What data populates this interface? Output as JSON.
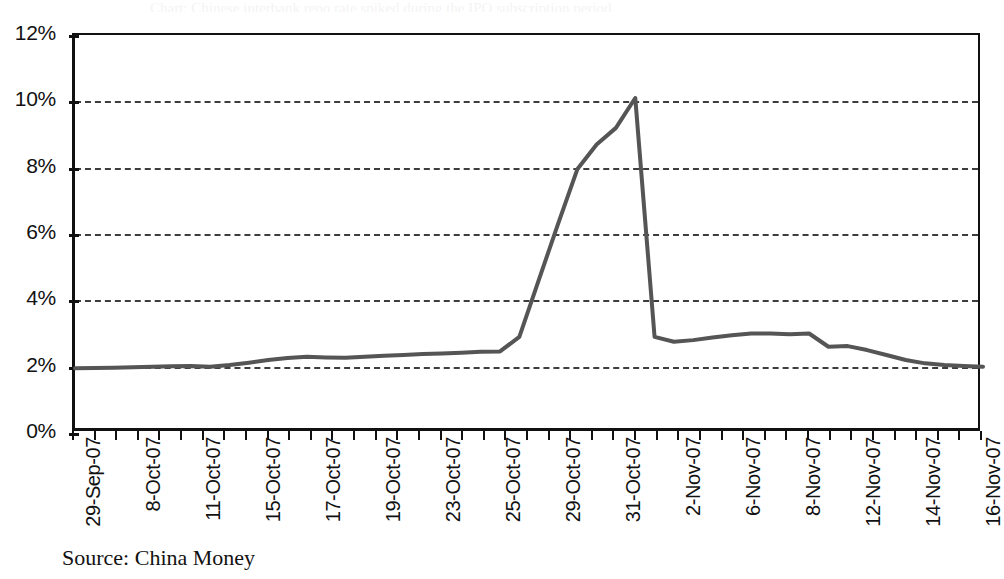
{
  "figure": {
    "source_note": "Source: China Money",
    "header_remnant": "Chart: Chinese interbank repo rate spiked during the IPO subscription period"
  },
  "chart_data": {
    "type": "line",
    "title": "",
    "xlabel": "",
    "ylabel": "",
    "ylim": [
      0,
      12
    ],
    "ytick_values": [
      0,
      2,
      4,
      6,
      8,
      10,
      12
    ],
    "ytick_labels": [
      "0%",
      "2%",
      "4%",
      "6%",
      "8%",
      "10%",
      "12%"
    ],
    "grid": true,
    "grid_style": "dashed-horizontal",
    "legend": "none",
    "series_color": "#555555",
    "series_width_px": 4,
    "x_tick_count": 42,
    "xtick_labels": [
      "29-Sep-07",
      "8-Oct-07",
      "11-Oct-07",
      "15-Oct-07",
      "17-Oct-07",
      "19-Oct-07",
      "23-Oct-07",
      "25-Oct-07",
      "29-Oct-07",
      "31-Oct-07",
      "2-Nov-07",
      "6-Nov-07",
      "8-Nov-07",
      "12-Nov-07",
      "14-Nov-07",
      "16-Nov-07"
    ],
    "xtick_label_positions": [
      0,
      60,
      120,
      180,
      240,
      300,
      360,
      420,
      480,
      540,
      600,
      660,
      720,
      780,
      840,
      900
    ],
    "series": [
      {
        "name": "Interbank repo rate",
        "values": [
          1.95,
          1.96,
          1.97,
          1.98,
          2.0,
          2.01,
          2.02,
          2.0,
          2.05,
          2.12,
          2.2,
          2.26,
          2.3,
          2.28,
          2.27,
          2.3,
          2.33,
          2.35,
          2.38,
          2.4,
          2.42,
          2.45,
          2.46,
          2.9,
          4.6,
          6.3,
          7.95,
          8.7,
          9.2,
          10.1,
          2.9,
          2.75,
          2.8,
          2.88,
          2.95,
          3.0,
          3.0,
          2.98,
          3.0,
          2.6,
          2.62,
          2.5,
          2.35,
          2.2,
          2.1,
          2.05,
          2.02,
          2.0
        ]
      }
    ],
    "annotations": {
      "peak_value": 10.1,
      "trough_after_peak": 2.75,
      "start_value": 1.95,
      "end_value": 2.0
    }
  }
}
